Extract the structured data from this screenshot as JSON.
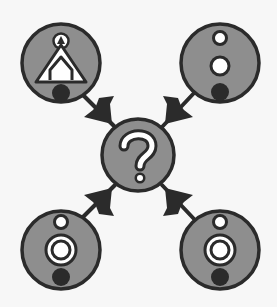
{
  "diagram": {
    "type": "hub-and-spoke",
    "colors": {
      "background": "#f7f7f7",
      "node_fill": "#8e8e8e",
      "stroke": "#2b2b2b",
      "symbol_white": "#ffffff",
      "symbol_dark": "#2b2b2b"
    },
    "center_node": {
      "label": "?",
      "icon": "question-mark-icon"
    },
    "nodes": [
      {
        "position": "top-left",
        "icon": "triangle-house-glyph-icon",
        "arrow": "toward-center"
      },
      {
        "position": "top-right",
        "icon": "two-circles-dot-glyph-icon",
        "arrow": "toward-center"
      },
      {
        "position": "bottom-left",
        "icon": "ring-circle-dot-glyph-icon",
        "arrow": "toward-center"
      },
      {
        "position": "bottom-right",
        "icon": "ring-circle-dot-glyph-icon",
        "arrow": "toward-center"
      }
    ]
  }
}
